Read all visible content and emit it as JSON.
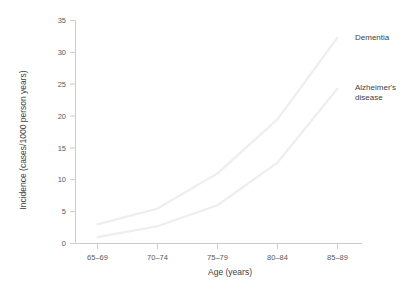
{
  "chart_data": {
    "type": "line",
    "title": "",
    "xlabel": "Age (years)",
    "ylabel": "Incidence (cases/1000 person years)",
    "categories": [
      "65–69",
      "70–74",
      "75–79",
      "80–84",
      "85–89"
    ],
    "ylim": [
      0,
      35
    ],
    "yticks": [
      0,
      5,
      10,
      15,
      20,
      25,
      30,
      35
    ],
    "ytick_labels": [
      "0",
      "5",
      "10",
      "15",
      "20",
      "25",
      "30",
      "35"
    ],
    "grid": false,
    "legend_position": "inline-right-end-of-line",
    "series": [
      {
        "name": "Dementia",
        "label": "Dementia",
        "color": "#eeeeee",
        "values": [
          3.0,
          5.5,
          11.0,
          19.5,
          32.3
        ]
      },
      {
        "name": "Alzheimer's disease",
        "label": "Alzheimer's disease",
        "label_line1": "Alzheimer's",
        "label_line2": "disease",
        "color": "#eeeeee",
        "values": [
          1.0,
          2.7,
          6.0,
          12.7,
          24.3
        ]
      }
    ],
    "annotations": [
      {
        "text": "Dementia",
        "series": "Dementia"
      },
      {
        "text": "Alzheimer's disease",
        "series": "Alzheimer's disease"
      }
    ],
    "axis_color": "#cccccc",
    "text_color": "#4a4a4a"
  }
}
